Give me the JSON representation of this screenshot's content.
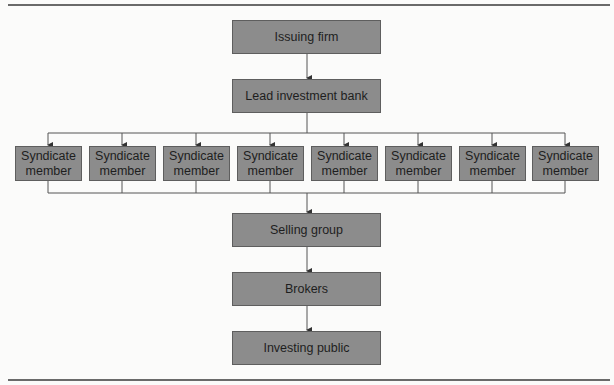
{
  "diagram": {
    "nodes": {
      "issuing_firm": "Issuing firm",
      "lead_bank": "Lead investment bank",
      "syndicate": [
        {
          "line1": "Syndicate",
          "line2": "member"
        },
        {
          "line1": "Syndicate",
          "line2": "member"
        },
        {
          "line1": "Syndicate",
          "line2": "member"
        },
        {
          "line1": "Syndicate",
          "line2": "member"
        },
        {
          "line1": "Syndicate",
          "line2": "member"
        },
        {
          "line1": "Syndicate",
          "line2": "member"
        },
        {
          "line1": "Syndicate",
          "line2": "member"
        },
        {
          "line1": "Syndicate",
          "line2": "member"
        }
      ],
      "selling_group": "Selling group",
      "brokers": "Brokers",
      "investing_public": "Investing public"
    },
    "edges": [
      [
        "Issuing firm",
        "Lead investment bank"
      ],
      [
        "Lead investment bank",
        "Syndicate member (x8)"
      ],
      [
        "Syndicate member (x8)",
        "Selling group"
      ],
      [
        "Selling group",
        "Brokers"
      ],
      [
        "Brokers",
        "Investing public"
      ]
    ],
    "colors": {
      "box_fill": "#8c8c8c",
      "box_border": "#5e5e5e",
      "line": "#555555"
    }
  }
}
